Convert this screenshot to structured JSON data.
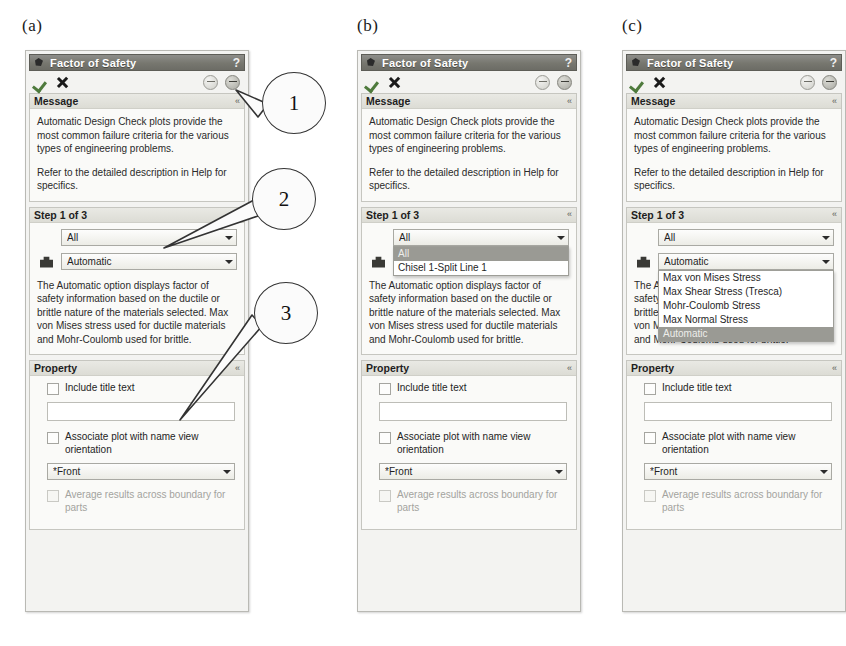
{
  "figure": {
    "labels": [
      "(a)",
      "(b)",
      "(c)"
    ],
    "callouts": [
      {
        "number": "1",
        "target": "collapse-button"
      },
      {
        "number": "2",
        "target": "step-1-of-3-section"
      },
      {
        "number": "3",
        "target": "property-section"
      }
    ]
  },
  "panel": {
    "title": "Factor of Safety",
    "help_label": "?",
    "toolbar": {
      "accept_label": "✓",
      "cancel_label": "✕",
      "help_button_label": "",
      "collapse_button_label": ""
    },
    "message_section": {
      "header": "Message",
      "collapse_chevron": "«",
      "paragraphs": [
        "Automatic Design Check plots provide the most common failure criteria for the various types of engineering problems.",
        "Refer to the detailed description in Help for specifics."
      ]
    },
    "step_section": {
      "header": "Step 1 of 3",
      "collapse_chevron": "«",
      "scope_combo": {
        "value": "All",
        "options": [
          "All",
          "Chisel 1-Split Line 1"
        ]
      },
      "criterion_combo": {
        "value": "Automatic",
        "options": [
          "Max von Mises Stress",
          "Max Shear Stress (Tresca)",
          "Mohr-Coulomb Stress",
          "Max Normal Stress",
          "Automatic"
        ]
      },
      "description": "The Automatic option displays factor of safety information based on the ductile or brittle nature of the materials selected. Max von Mises stress used for ductile materials and Mohr-Coulomb used for brittle."
    },
    "property_section": {
      "header": "Property",
      "collapse_chevron": "«",
      "include_title_text_label": "Include title text",
      "title_text_value": "",
      "associate_plot_label": "Associate plot with name view orientation",
      "view_combo": {
        "value": "*Front",
        "options": [
          "*Front"
        ]
      },
      "average_results_label": "Average results across boundary for parts"
    }
  },
  "panels": [
    {
      "id": "a",
      "open_dropdown": "none"
    },
    {
      "id": "b",
      "open_dropdown": "scope"
    },
    {
      "id": "c",
      "open_dropdown": "criterion"
    }
  ]
}
